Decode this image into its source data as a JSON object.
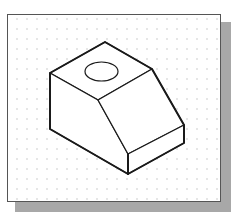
{
  "figure": {
    "colors": {
      "background": "#ffffff",
      "frame_border": "#555555",
      "shadow": "#a8a8a8",
      "grid_dots": "#b8b8b8",
      "lines": "#1a1a1a"
    },
    "grid": {
      "spacing_x": 10,
      "spacing_y": 10,
      "type": "dot"
    },
    "vertices": {
      "top_back": [
        105,
        42
      ],
      "top_left": [
        50,
        73
      ],
      "top_right": [
        152,
        69
      ],
      "top_front": [
        98,
        100
      ],
      "bottom_left": [
        50,
        129
      ],
      "step_right_top": [
        184,
        125
      ],
      "step_right_bottom": [
        184,
        143
      ],
      "front_top": [
        128,
        154
      ],
      "front_bottom": [
        128,
        174
      ]
    },
    "hole": {
      "cx": 101.5,
      "cy": 71.5,
      "rx": 16.5,
      "ry": 9.5
    }
  }
}
